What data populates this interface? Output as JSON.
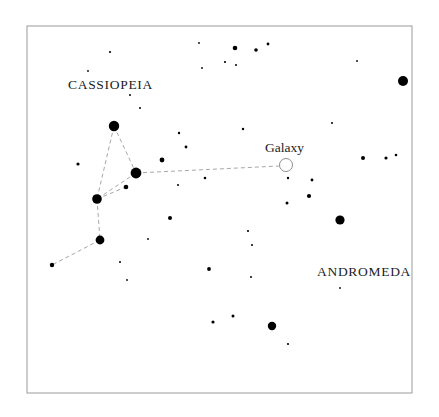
{
  "chart_data": {
    "type": "scatter",
    "title": "",
    "subtitle": "",
    "xlabel": "",
    "ylabel": "",
    "grid": false,
    "legend": "none",
    "xlim": [
      0,
      439
    ],
    "ylim": [
      0,
      417
    ],
    "frame": {
      "x": 27,
      "y": 26,
      "width": 385,
      "height": 367,
      "stroke": "#9a9a9a",
      "fill": "#ffffff"
    },
    "labels": [
      {
        "id": "cassiopeia",
        "text": "CASSIOPEIA",
        "x": 68,
        "y": 89,
        "anchor": "start",
        "style": "constellation"
      },
      {
        "id": "andromeda",
        "text": "ANDROMEDA",
        "x": 317,
        "y": 276,
        "anchor": "start",
        "style": "constellation"
      },
      {
        "id": "galaxy",
        "text": "Galaxy",
        "x": 265,
        "y": 152,
        "anchor": "start",
        "style": "object"
      }
    ],
    "constellation_lines": {
      "stroke": "#a8a8a8",
      "dash": "4,3",
      "width": 1,
      "segments": [
        {
          "from": [
            114,
            126
          ],
          "to": [
            97,
            199
          ]
        },
        {
          "from": [
            114,
            126
          ],
          "to": [
            136,
            173
          ]
        },
        {
          "from": [
            136,
            173
          ],
          "to": [
            97,
            199
          ]
        },
        {
          "from": [
            97,
            199
          ],
          "to": [
            100,
            240
          ]
        },
        {
          "from": [
            100,
            240
          ],
          "to": [
            52,
            265
          ]
        },
        {
          "from": [
            97,
            199
          ],
          "to": [
            126,
            187
          ]
        }
      ]
    },
    "galaxy_marker": {
      "cx": 286,
      "cy": 165,
      "r": 6.5,
      "stroke": "#8e8e8e",
      "fill": "none"
    },
    "galaxy_line": {
      "from": [
        136,
        173
      ],
      "to": [
        279,
        166
      ],
      "stroke": "#a8a8a8",
      "dash": "4,3"
    },
    "stars": [
      {
        "x": 114,
        "y": 126,
        "r": 5.2,
        "mag": "bright"
      },
      {
        "x": 136,
        "y": 173,
        "r": 5.4,
        "mag": "bright"
      },
      {
        "x": 97,
        "y": 199,
        "r": 4.8,
        "mag": "bright"
      },
      {
        "x": 100,
        "y": 240,
        "r": 4.4,
        "mag": "bright"
      },
      {
        "x": 403,
        "y": 81,
        "r": 5.0,
        "mag": "bright"
      },
      {
        "x": 340,
        "y": 220,
        "r": 4.6,
        "mag": "bright"
      },
      {
        "x": 272,
        "y": 326,
        "r": 4.2,
        "mag": "bright"
      },
      {
        "x": 126,
        "y": 187,
        "r": 2.3,
        "mag": "medium"
      },
      {
        "x": 52,
        "y": 265,
        "r": 2.2,
        "mag": "medium"
      },
      {
        "x": 162,
        "y": 160,
        "r": 2.4,
        "mag": "medium"
      },
      {
        "x": 235,
        "y": 48,
        "r": 2.3,
        "mag": "medium"
      },
      {
        "x": 256,
        "y": 50,
        "r": 1.8,
        "mag": "medium"
      },
      {
        "x": 268,
        "y": 44,
        "r": 1.4,
        "mag": "faint"
      },
      {
        "x": 170,
        "y": 218,
        "r": 2.0,
        "mag": "medium"
      },
      {
        "x": 209,
        "y": 269,
        "r": 1.9,
        "mag": "medium"
      },
      {
        "x": 213,
        "y": 322,
        "r": 1.6,
        "mag": "faint"
      },
      {
        "x": 233,
        "y": 316,
        "r": 1.5,
        "mag": "faint"
      },
      {
        "x": 309,
        "y": 196,
        "r": 2.1,
        "mag": "medium"
      },
      {
        "x": 312,
        "y": 180,
        "r": 1.4,
        "mag": "faint"
      },
      {
        "x": 363,
        "y": 158,
        "r": 2.0,
        "mag": "medium"
      },
      {
        "x": 386,
        "y": 158,
        "r": 1.6,
        "mag": "faint"
      },
      {
        "x": 396,
        "y": 155,
        "r": 1.3,
        "mag": "faint"
      },
      {
        "x": 78,
        "y": 164,
        "r": 1.6,
        "mag": "faint"
      },
      {
        "x": 186,
        "y": 147,
        "r": 1.4,
        "mag": "faint"
      },
      {
        "x": 179,
        "y": 133,
        "r": 1.2,
        "mag": "faint"
      },
      {
        "x": 205,
        "y": 178,
        "r": 1.3,
        "mag": "faint"
      },
      {
        "x": 288,
        "y": 178,
        "r": 1.2,
        "mag": "faint"
      },
      {
        "x": 287,
        "y": 203,
        "r": 1.5,
        "mag": "faint"
      },
      {
        "x": 243,
        "y": 129,
        "r": 1.2,
        "mag": "faint"
      },
      {
        "x": 225,
        "y": 62,
        "r": 1.1,
        "mag": "faint"
      },
      {
        "x": 236,
        "y": 65,
        "r": 1.0,
        "mag": "faint"
      },
      {
        "x": 110,
        "y": 52,
        "r": 1.1,
        "mag": "faint"
      },
      {
        "x": 130,
        "y": 95,
        "r": 1.0,
        "mag": "faint"
      },
      {
        "x": 140,
        "y": 108,
        "r": 1.0,
        "mag": "faint"
      },
      {
        "x": 88,
        "y": 71,
        "r": 0.9,
        "mag": "faint"
      },
      {
        "x": 178,
        "y": 185,
        "r": 1.0,
        "mag": "faint"
      },
      {
        "x": 248,
        "y": 231,
        "r": 1.1,
        "mag": "faint"
      },
      {
        "x": 252,
        "y": 245,
        "r": 1.0,
        "mag": "faint"
      },
      {
        "x": 251,
        "y": 277,
        "r": 1.0,
        "mag": "faint"
      },
      {
        "x": 340,
        "y": 288,
        "r": 0.9,
        "mag": "faint"
      },
      {
        "x": 288,
        "y": 344,
        "r": 1.1,
        "mag": "faint"
      },
      {
        "x": 120,
        "y": 262,
        "r": 1.0,
        "mag": "faint"
      },
      {
        "x": 127,
        "y": 280,
        "r": 0.9,
        "mag": "faint"
      },
      {
        "x": 148,
        "y": 239,
        "r": 0.9,
        "mag": "faint"
      },
      {
        "x": 332,
        "y": 123,
        "r": 1.0,
        "mag": "faint"
      },
      {
        "x": 357,
        "y": 61,
        "r": 0.9,
        "mag": "faint"
      },
      {
        "x": 199,
        "y": 43,
        "r": 0.9,
        "mag": "faint"
      },
      {
        "x": 202,
        "y": 68,
        "r": 0.9,
        "mag": "faint"
      }
    ]
  }
}
